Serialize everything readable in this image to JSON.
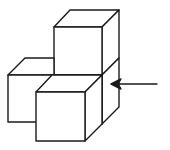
{
  "diagram": {
    "title": "",
    "cube_count": 4,
    "stroke_color": "#1a1a1a",
    "background_color": "#ffffff",
    "arrow": {
      "direction": "left",
      "from": [
        157,
        84
      ],
      "to": [
        111,
        84
      ]
    }
  }
}
